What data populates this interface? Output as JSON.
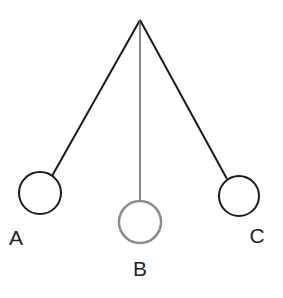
{
  "diagram": {
    "pivot": {
      "x": 140,
      "y": 20
    },
    "positions": [
      {
        "label": "A",
        "bob_x": 40,
        "bob_y": 193,
        "radius": 21,
        "label_x": 16,
        "label_y": 245,
        "color": "#1a1a1a"
      },
      {
        "label": "B",
        "bob_x": 140,
        "bob_y": 222,
        "radius": 21,
        "label_x": 140,
        "label_y": 276,
        "color": "#808080"
      },
      {
        "label": "C",
        "bob_x": 239,
        "bob_y": 196,
        "radius": 20,
        "label_x": 257,
        "label_y": 243,
        "color": "#1a1a1a"
      }
    ]
  }
}
